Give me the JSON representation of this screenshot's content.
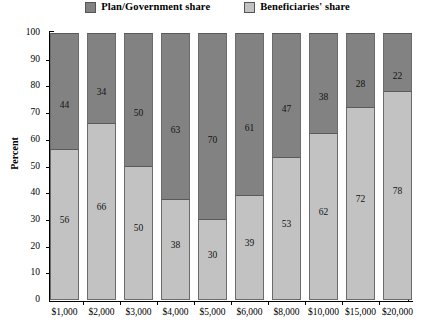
{
  "chart_data": {
    "type": "bar",
    "subtype": "stacked-100-percent",
    "title": "",
    "xlabel": "",
    "ylabel": "Percent",
    "ylim": [
      0,
      100
    ],
    "ytick_step": 10,
    "yticks": [
      100,
      90,
      80,
      70,
      60,
      50,
      40,
      30,
      20,
      10,
      0
    ],
    "grid": false,
    "legend_position": "top-center",
    "categories": [
      "$1,000",
      "$2,000",
      "$3,000",
      "$4,000",
      "$5,000",
      "$6,000",
      "$8,000",
      "$10,000",
      "$15,000",
      "$20,000"
    ],
    "series": [
      {
        "name": "Plan/Government share",
        "color": "#828282",
        "stack_position": "top",
        "values": [
          44,
          34,
          50,
          63,
          70,
          61,
          47,
          38,
          28,
          22
        ]
      },
      {
        "name": "Beneficiaries' share",
        "color": "#c2c2c2",
        "stack_position": "bottom",
        "values": [
          56,
          66,
          50,
          38,
          30,
          39,
          53,
          62,
          72,
          78
        ]
      }
    ]
  },
  "legend": {
    "items": [
      {
        "label": "Plan/Government share",
        "color": "#828282"
      },
      {
        "label": "Beneficiaries' share",
        "color": "#c2c2c2"
      }
    ]
  },
  "axes": {
    "y_title": "Percent"
  }
}
